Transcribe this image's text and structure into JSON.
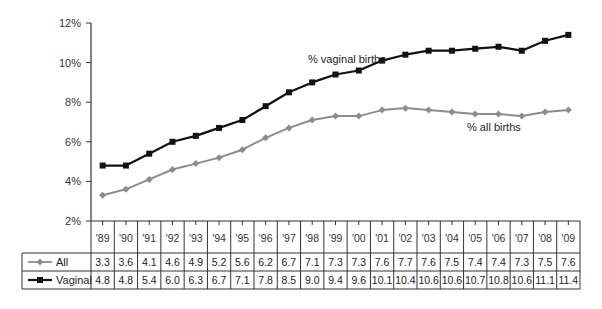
{
  "chart_data": {
    "type": "line",
    "title": "",
    "xlabel": "",
    "ylabel": "",
    "ylim": [
      2,
      12
    ],
    "yticks": [
      "2%",
      "4%",
      "6%",
      "8%",
      "10%",
      "12%"
    ],
    "ytick_values": [
      2,
      4,
      6,
      8,
      10,
      12
    ],
    "grid": false,
    "legend_position": "data-table-left",
    "categories": [
      "'89",
      "'90",
      "'91",
      "'92",
      "'93",
      "'94",
      "'95",
      "'96",
      "'97",
      "'98",
      "'99",
      "'00",
      "'01",
      "'02",
      "'03",
      "'04",
      "'05",
      "'06",
      "'07",
      "'08",
      "'09"
    ],
    "series": [
      {
        "name": "All",
        "annotation": "% all births",
        "color": "#8c8c8c",
        "marker": "diamond-cross",
        "values": [
          3.3,
          3.6,
          4.1,
          4.6,
          4.9,
          5.2,
          5.6,
          6.2,
          6.7,
          7.1,
          7.3,
          7.3,
          7.6,
          7.7,
          7.6,
          7.5,
          7.4,
          7.4,
          7.3,
          7.5,
          7.6
        ],
        "table_labels": [
          "3.3",
          "3.6",
          "4.1",
          "4.6",
          "4.9",
          "5.2",
          "5.6",
          "6.2",
          "6.7",
          "7.1",
          "7.3",
          "7.3",
          "7.6",
          "7.7",
          "7.6",
          "7.5",
          "7.4",
          "7.4",
          "7.3",
          "7.5",
          "7.6"
        ]
      },
      {
        "name": "Vaginal",
        "annotation": "% vaginal births",
        "color": "#111111",
        "marker": "square",
        "values": [
          4.8,
          4.8,
          5.4,
          6.0,
          6.3,
          6.7,
          7.1,
          7.8,
          8.5,
          9.0,
          9.4,
          9.6,
          10.1,
          10.4,
          10.6,
          10.6,
          10.7,
          10.8,
          10.6,
          11.1,
          11.4
        ],
        "table_labels": [
          "4.8",
          "4.8",
          "5.4",
          "6.0",
          "6.3",
          "6.7",
          "7.1",
          "7.8",
          "8.5",
          "9.0",
          "9.4",
          "9.6",
          "10.1",
          "10.4",
          "10.6",
          "10.6",
          "10.7",
          "10.8",
          "10.6",
          "11.1",
          "11.4"
        ]
      }
    ],
    "annotations": [
      {
        "text": "% vaginal births",
        "series": "Vaginal"
      },
      {
        "text": "% all births",
        "series": "All"
      }
    ],
    "data_table": true
  }
}
